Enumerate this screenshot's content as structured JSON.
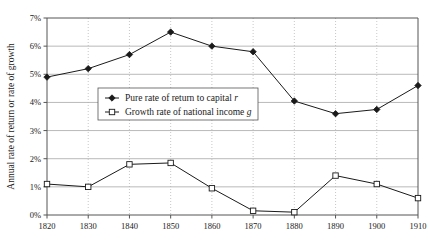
{
  "chart_data": {
    "type": "line",
    "title": "",
    "xlabel": "",
    "ylabel": "Annual rate of return or rate of growth",
    "x": [
      1820,
      1830,
      1840,
      1850,
      1860,
      1870,
      1880,
      1890,
      1900,
      1910
    ],
    "xtick_labels": [
      "1820",
      "1830",
      "1840",
      "1850",
      "1860",
      "1870",
      "1880",
      "1890",
      "1900",
      "1910"
    ],
    "xlim": [
      1820,
      1910
    ],
    "ytick_labels": [
      "0%",
      "1%",
      "2%",
      "3%",
      "4%",
      "5%",
      "6%",
      "7%"
    ],
    "ytick_values": [
      0,
      1,
      2,
      3,
      4,
      5,
      6,
      7
    ],
    "ylim": [
      0,
      7
    ],
    "yunit": "%",
    "grid": {
      "horizontal": true,
      "vertical": true,
      "horizontal_style": "solid",
      "vertical_style": "dotted"
    },
    "legend_position": "inside-upper-left",
    "series": [
      {
        "name": "Pure rate of return to capital r",
        "label_plain": "Pure rate of return to capital",
        "label_italic": "r",
        "marker": "filled-diamond",
        "color": "#1a1a1a",
        "values": [
          4.9,
          5.2,
          5.7,
          6.5,
          6.0,
          5.8,
          4.05,
          3.6,
          3.75,
          4.6
        ]
      },
      {
        "name": "Growth rate of national income g",
        "label_plain": "Growth rate of national income",
        "label_italic": "g",
        "marker": "open-square",
        "color": "#1a1a1a",
        "values": [
          1.1,
          1.0,
          1.8,
          1.85,
          0.95,
          0.15,
          0.1,
          1.4,
          1.1,
          0.6
        ]
      }
    ]
  },
  "colors": {
    "background": "#ffffff",
    "ink": "#1a1a1a",
    "axis": "#555555",
    "grid_horizontal": "#9a9a9a",
    "grid_vertical": "#b0b0b0"
  },
  "geometry": {
    "plot_left": 47,
    "plot_right": 418,
    "plot_top": 18,
    "plot_bottom": 215,
    "legend_x": 98,
    "legend_y": 88,
    "legend_w": 160,
    "legend_h": 32
  }
}
